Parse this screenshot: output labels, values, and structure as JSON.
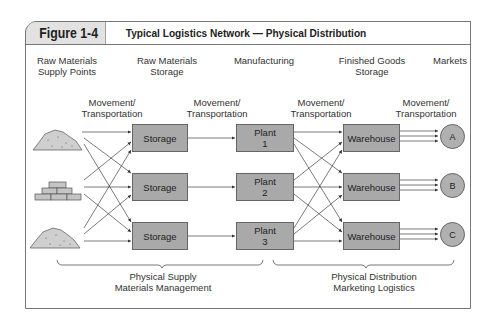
{
  "figure": {
    "number": "Figure 1-4",
    "title": "Typical Logistics Network — Physical Distribution"
  },
  "stages": [
    {
      "line1": "Raw Materials",
      "line2": "Supply Points"
    },
    {
      "line1": "Raw Materials",
      "line2": "Storage"
    },
    {
      "line1": "Manufacturing",
      "line2": ""
    },
    {
      "line1": "Finished Goods",
      "line2": "Storage"
    },
    {
      "line1": "Markets",
      "line2": ""
    }
  ],
  "movement_labels": [
    {
      "line1": "Movement/",
      "line2": "Transportation"
    },
    {
      "line1": "Movement/",
      "line2": "Transportation"
    },
    {
      "line1": "Movement/",
      "line2": "Transportation"
    },
    {
      "line1": "Movement/",
      "line2": "Transportation"
    }
  ],
  "supply_points": [
    {
      "icon": "raw-material-pile-icon"
    },
    {
      "icon": "bricks-icon"
    },
    {
      "icon": "raw-material-pile-icon"
    }
  ],
  "storage": [
    {
      "label": "Storage"
    },
    {
      "label": "Storage"
    },
    {
      "label": "Storage"
    }
  ],
  "plants": [
    {
      "line1": "Plant",
      "line2": "1"
    },
    {
      "line1": "Plant",
      "line2": "2"
    },
    {
      "line1": "Plant",
      "line2": "3"
    }
  ],
  "warehouses": [
    {
      "label": "Warehouse"
    },
    {
      "label": "Warehouse"
    },
    {
      "label": "Warehouse"
    }
  ],
  "markets": [
    {
      "label": "A"
    },
    {
      "label": "B"
    },
    {
      "label": "C"
    }
  ],
  "groups": [
    {
      "line1": "Physical Supply",
      "line2": "Materials Management"
    },
    {
      "line1": "Physical Distribution",
      "line2": "Marketing Logistics"
    }
  ],
  "colors": {
    "box_fill": "#a9a9a9",
    "header_tab_fill": "#e2e2e2",
    "border": "#666666"
  }
}
